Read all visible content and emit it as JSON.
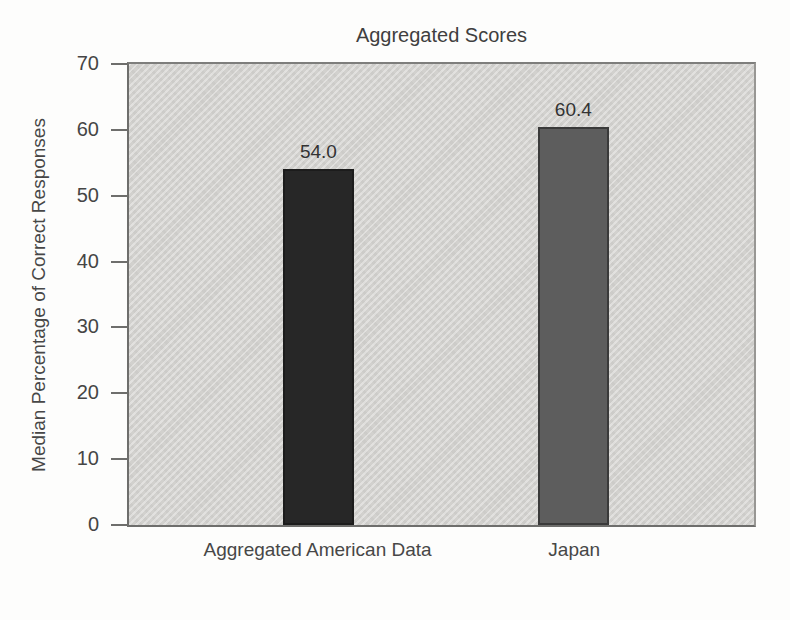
{
  "chart_data": {
    "type": "bar",
    "title": "Aggregated Scores",
    "xlabel": "",
    "ylabel": "Median Percentage of Correct Responses",
    "categories": [
      "Aggregated American Data",
      "Japan"
    ],
    "values": [
      54.0,
      60.4
    ],
    "value_labels": [
      "54.0",
      "60.4"
    ],
    "bar_colors": [
      "#272727",
      "#5d5d5d"
    ],
    "bar_border_colors": [
      "#1c1c1c",
      "#3a3a3a"
    ],
    "ylim": [
      0,
      70
    ],
    "yticks": [
      0,
      10,
      20,
      30,
      40,
      50,
      60,
      70
    ],
    "grid": false,
    "legend": "none",
    "plot_background": "#d7d6d3",
    "axis_color": "#6e6e6c",
    "text_color": "#454545"
  }
}
